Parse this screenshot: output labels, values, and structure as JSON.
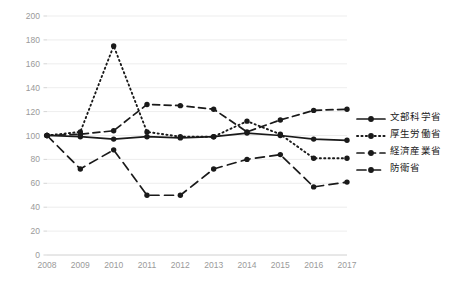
{
  "chart_data": {
    "type": "line",
    "title": "",
    "subtitle": "",
    "xlabel": "",
    "ylabel": "",
    "categories": [
      "2008",
      "2009",
      "2010",
      "2011",
      "2012",
      "2013",
      "2014",
      "2015",
      "2016",
      "2017"
    ],
    "ylim": [
      0,
      200
    ],
    "ytick_values": [
      0,
      20,
      40,
      60,
      80,
      100,
      120,
      140,
      160,
      180,
      200
    ],
    "ytick_labels": [
      "0",
      "20",
      "40",
      "60",
      "80",
      "100",
      "120",
      "140",
      "160",
      "180",
      "200"
    ],
    "grid": true,
    "legend_position": "right",
    "series": [
      {
        "name": "文部科学省",
        "line_style": "solid",
        "color": "#1a1a1a",
        "marker": "circle",
        "values": [
          100,
          99,
          97,
          99,
          98,
          99,
          102,
          100,
          97,
          96
        ]
      },
      {
        "name": "厚生労働省",
        "line_style": "dotted",
        "color": "#1a1a1a",
        "marker": "circle",
        "values": [
          100,
          103,
          175,
          103,
          99,
          99,
          112,
          101,
          81,
          81
        ]
      },
      {
        "name": "経済産業省",
        "line_style": "dashed",
        "color": "#1a1a1a",
        "marker": "circle",
        "values": [
          100,
          101,
          104,
          126,
          125,
          122,
          103,
          113,
          121,
          122
        ]
      },
      {
        "name": "防衛省",
        "line_style": "longdash",
        "color": "#1a1a1a",
        "marker": "circle",
        "values": [
          100,
          72,
          88,
          50,
          50,
          72,
          80,
          84,
          57,
          61
        ]
      }
    ]
  },
  "legend": {
    "items": [
      {
        "label": "文部科学省",
        "style": "solid"
      },
      {
        "label": "厚生労働省",
        "style": "dotted"
      },
      {
        "label": "経済産業省",
        "style": "dashed"
      },
      {
        "label": "防衛省",
        "style": "longdash"
      }
    ]
  },
  "colors": {
    "ink": "#1a1a1a",
    "grid": "#e8e8e8",
    "tick_text": "#9a9a9a"
  }
}
